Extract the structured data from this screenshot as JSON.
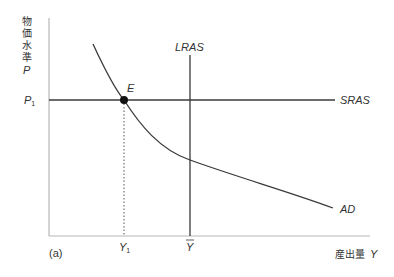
{
  "diagram": {
    "panel_label": "(a)",
    "y_axis": {
      "label_chars": [
        "物",
        "価",
        "水",
        "準"
      ],
      "symbol": "P",
      "tick_label": "P",
      "tick_sub": "1"
    },
    "x_axis": {
      "label": "産出量",
      "symbol": "Y",
      "ticks": [
        {
          "label": "Y",
          "sub": "1"
        },
        {
          "label": "Y",
          "bar": true
        }
      ]
    },
    "curves": {
      "lras": "LRAS",
      "sras": "SRAS",
      "ad": "AD"
    },
    "equilibrium_point": "E",
    "colors": {
      "line": "#3a3a3a",
      "axis": "#b8b8b8",
      "point": "#111111"
    }
  }
}
